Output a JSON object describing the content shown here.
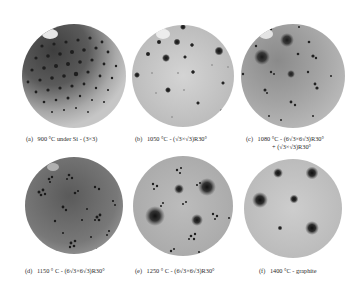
{
  "figure": {
    "panels": [
      {
        "id": "a",
        "label": "(a)",
        "caption": "900 °C under Si  - (3×3)",
        "caption_line2": "",
        "disc": {
          "cx": 74,
          "cy": 76,
          "r": 52
        },
        "base_tone": "#8e8e8e",
        "dark_region": {
          "cx": 55,
          "cy": 50,
          "r": 48,
          "color": "#4a4a4a"
        },
        "highlight": {
          "cx": 50,
          "cy": 34,
          "rx": 8,
          "ry": 6
        },
        "spots_type": "lattice"
      },
      {
        "id": "b",
        "label": "(b)",
        "caption": "1050 °C - (√3×√3)R30°",
        "caption_line2": "",
        "disc": {
          "cx": 183,
          "cy": 76,
          "r": 51
        },
        "base_tone": "#c8c8c8",
        "highlight": {
          "cx": 163,
          "cy": 34,
          "rx": 7,
          "ry": 5
        },
        "spots_type": "sparse"
      },
      {
        "id": "c",
        "label": "(c)",
        "caption": "1080 °C - (6√3×6√3)R30°",
        "caption_line2": "+ (√3×√3)R30°",
        "disc": {
          "cx": 293,
          "cy": 76,
          "r": 52
        },
        "base_tone": "#a8a8a8",
        "highlight": {
          "cx": 270,
          "cy": 34,
          "rx": 7,
          "ry": 5
        },
        "spots_type": "mixed"
      },
      {
        "id": "d",
        "label": "(d)",
        "caption": "1150 ° C - (6√3×6√3)R30°",
        "caption_line2": "",
        "disc": {
          "cx": 74,
          "cy": 205,
          "r": 49
        },
        "base_tone": "#707070",
        "spots_type": "clusters-dark"
      },
      {
        "id": "e",
        "label": "(e)",
        "caption": "1250 ° C - (6√3×6√3)R30°",
        "caption_line2": "",
        "disc": {
          "cx": 183,
          "cy": 206,
          "r": 50
        },
        "base_tone": "#b4b4b4",
        "spots_type": "clusters"
      },
      {
        "id": "f",
        "label": "(f)",
        "caption": "1400 °C - graphite",
        "caption_line2": "",
        "disc": {
          "cx": 293,
          "cy": 208,
          "r": 49
        },
        "base_tone": "#c4c4c4",
        "spots_type": "graphite"
      }
    ]
  }
}
